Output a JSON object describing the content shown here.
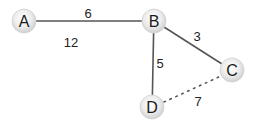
{
  "diagram": {
    "type": "weighted-graph",
    "nodes": [
      {
        "id": "A",
        "label": "A",
        "x": 24,
        "y": 21
      },
      {
        "id": "B",
        "label": "B",
        "x": 154,
        "y": 21
      },
      {
        "id": "C",
        "label": "C",
        "x": 232,
        "y": 70
      },
      {
        "id": "D",
        "label": "D",
        "x": 152,
        "y": 107
      }
    ],
    "edges": [
      {
        "from": "A",
        "to": "B",
        "weight": "6",
        "style": "solid",
        "label_x": 88,
        "label_y": 13
      },
      {
        "from": "B",
        "to": "C",
        "weight": "3",
        "style": "solid",
        "label_x": 197,
        "label_y": 36
      },
      {
        "from": "B",
        "to": "D",
        "weight": "5",
        "style": "solid",
        "label_x": 160,
        "label_y": 63
      },
      {
        "from": "D",
        "to": "C",
        "weight": "7",
        "style": "dotted",
        "label_x": 198,
        "label_y": 101
      }
    ],
    "free_labels": [
      {
        "text": "12",
        "x": 71,
        "y": 42
      }
    ]
  },
  "colors": {
    "edge": "#555555",
    "node_fill_center": "#ffffff",
    "node_fill_edge": "#cfcfcf",
    "text": "#1a1a1a"
  }
}
